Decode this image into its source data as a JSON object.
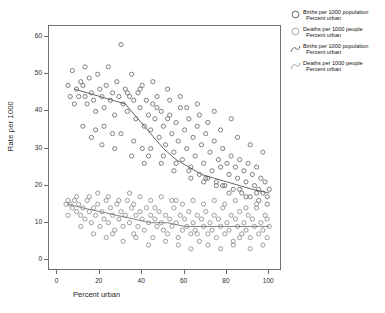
{
  "chart_data": {
    "type": "scatter",
    "title": "",
    "xlabel": "Percent urban",
    "ylabel": "Rate per 1000",
    "xlim": [
      -4,
      106
    ],
    "ylim": [
      -3,
      63
    ],
    "xticks": [
      0,
      20,
      40,
      60,
      80,
      100
    ],
    "yticks": [
      0,
      10,
      20,
      30,
      40,
      50,
      60
    ],
    "grid": false,
    "legend_position": "right",
    "marker": "open-circle",
    "series": [
      {
        "name": "Births per 1000 population",
        "sub": "Percent urban",
        "color": "#6a6a6a",
        "points": [
          [
            7,
            51
          ],
          [
            9,
            46
          ],
          [
            10,
            44
          ],
          [
            12,
            47
          ],
          [
            13,
            44
          ],
          [
            14,
            42
          ],
          [
            15,
            49
          ],
          [
            16,
            45
          ],
          [
            17,
            43
          ],
          [
            18,
            40
          ],
          [
            19,
            50
          ],
          [
            20,
            46
          ],
          [
            21,
            44
          ],
          [
            22,
            41
          ],
          [
            23,
            47
          ],
          [
            24,
            52
          ],
          [
            25,
            43
          ],
          [
            26,
            45
          ],
          [
            27,
            39
          ],
          [
            28,
            48
          ],
          [
            29,
            44
          ],
          [
            30,
            58
          ],
          [
            31,
            42
          ],
          [
            32,
            46
          ],
          [
            33,
            40
          ],
          [
            34,
            44
          ],
          [
            35,
            50
          ],
          [
            36,
            43
          ],
          [
            37,
            38
          ],
          [
            38,
            45
          ],
          [
            39,
            41
          ],
          [
            40,
            47
          ],
          [
            41,
            36
          ],
          [
            42,
            43
          ],
          [
            43,
            39
          ],
          [
            44,
            35
          ],
          [
            45,
            42
          ],
          [
            46,
            38
          ],
          [
            47,
            44
          ],
          [
            48,
            33
          ],
          [
            49,
            40
          ],
          [
            50,
            36
          ],
          [
            51,
            31
          ],
          [
            52,
            38
          ],
          [
            53,
            43
          ],
          [
            54,
            34
          ],
          [
            55,
            29
          ],
          [
            56,
            37
          ],
          [
            57,
            32
          ],
          [
            58,
            41
          ],
          [
            59,
            27
          ],
          [
            60,
            35
          ],
          [
            61,
            30
          ],
          [
            62,
            38
          ],
          [
            63,
            25
          ],
          [
            64,
            33
          ],
          [
            65,
            28
          ],
          [
            66,
            36
          ],
          [
            67,
            23
          ],
          [
            68,
            31
          ],
          [
            69,
            26
          ],
          [
            70,
            34
          ],
          [
            71,
            22
          ],
          [
            72,
            29
          ],
          [
            73,
            24
          ],
          [
            74,
            32
          ],
          [
            75,
            21
          ],
          [
            76,
            27
          ],
          [
            77,
            25
          ],
          [
            78,
            30
          ],
          [
            79,
            20
          ],
          [
            80,
            26
          ],
          [
            81,
            23
          ],
          [
            82,
            28
          ],
          [
            83,
            19
          ],
          [
            84,
            25
          ],
          [
            85,
            22
          ],
          [
            86,
            27
          ],
          [
            87,
            18
          ],
          [
            88,
            24
          ],
          [
            89,
            21
          ],
          [
            90,
            26
          ],
          [
            91,
            17
          ],
          [
            92,
            23
          ],
          [
            93,
            20
          ],
          [
            94,
            25
          ],
          [
            95,
            19
          ],
          [
            96,
            22
          ],
          [
            97,
            18
          ],
          [
            98,
            21
          ],
          [
            99,
            17
          ],
          [
            100,
            19
          ],
          [
            5,
            47
          ],
          [
            6,
            44
          ],
          [
            8,
            42
          ],
          [
            11,
            48
          ],
          [
            13,
            52
          ],
          [
            45,
            48
          ],
          [
            52,
            46
          ],
          [
            58,
            44
          ],
          [
            66,
            42
          ],
          [
            74,
            40
          ],
          [
            82,
            38
          ],
          [
            44,
            30
          ],
          [
            50,
            28
          ],
          [
            56,
            26
          ],
          [
            62,
            24
          ],
          [
            70,
            22
          ],
          [
            78,
            20
          ],
          [
            86,
            19
          ],
          [
            94,
            18
          ],
          [
            30,
            34
          ],
          [
            36,
            32
          ],
          [
            40,
            30
          ],
          [
            22,
            36
          ],
          [
            26,
            34
          ],
          [
            18,
            35
          ],
          [
            33,
            45
          ],
          [
            39,
            46
          ],
          [
            47,
            41
          ],
          [
            53,
            39
          ],
          [
            61,
            41
          ],
          [
            67,
            39
          ],
          [
            71,
            37
          ],
          [
            77,
            35
          ],
          [
            85,
            33
          ],
          [
            91,
            31
          ],
          [
            97,
            29
          ],
          [
            43,
            28
          ],
          [
            49,
            26
          ],
          [
            55,
            24
          ],
          [
            63,
            22
          ],
          [
            69,
            21
          ],
          [
            75,
            20
          ],
          [
            81,
            18
          ],
          [
            89,
            17
          ],
          [
            95,
            16
          ],
          [
            99,
            15
          ],
          [
            12,
            36
          ],
          [
            16,
            33
          ],
          [
            21,
            31
          ],
          [
            27,
            30
          ],
          [
            35,
            28
          ],
          [
            41,
            26
          ]
        ]
      },
      {
        "name": "Deaths per 1000 people",
        "sub": "Percent urban",
        "color": "#8c8c8c",
        "points": [
          [
            5,
            16
          ],
          [
            6,
            15
          ],
          [
            7,
            14
          ],
          [
            8,
            16
          ],
          [
            9,
            13
          ],
          [
            10,
            15
          ],
          [
            11,
            12
          ],
          [
            12,
            14
          ],
          [
            13,
            11
          ],
          [
            14,
            16
          ],
          [
            15,
            13
          ],
          [
            16,
            10
          ],
          [
            17,
            14
          ],
          [
            18,
            12
          ],
          [
            19,
            15
          ],
          [
            20,
            9
          ],
          [
            21,
            13
          ],
          [
            22,
            11
          ],
          [
            23,
            16
          ],
          [
            24,
            10
          ],
          [
            25,
            14
          ],
          [
            26,
            12
          ],
          [
            27,
            8
          ],
          [
            28,
            15
          ],
          [
            29,
            11
          ],
          [
            30,
            13
          ],
          [
            31,
            9
          ],
          [
            32,
            12
          ],
          [
            33,
            16
          ],
          [
            34,
            10
          ],
          [
            35,
            14
          ],
          [
            36,
            7
          ],
          [
            37,
            12
          ],
          [
            38,
            9
          ],
          [
            39,
            13
          ],
          [
            40,
            11
          ],
          [
            41,
            8
          ],
          [
            42,
            14
          ],
          [
            43,
            10
          ],
          [
            44,
            12
          ],
          [
            45,
            6
          ],
          [
            46,
            11
          ],
          [
            47,
            9
          ],
          [
            48,
            13
          ],
          [
            49,
            10
          ],
          [
            50,
            8
          ],
          [
            51,
            12
          ],
          [
            52,
            7
          ],
          [
            53,
            11
          ],
          [
            54,
            9
          ],
          [
            55,
            14
          ],
          [
            56,
            10
          ],
          [
            57,
            6
          ],
          [
            58,
            12
          ],
          [
            59,
            8
          ],
          [
            60,
            11
          ],
          [
            61,
            9
          ],
          [
            62,
            13
          ],
          [
            63,
            7
          ],
          [
            64,
            10
          ],
          [
            65,
            8
          ],
          [
            66,
            12
          ],
          [
            67,
            5
          ],
          [
            68,
            11
          ],
          [
            69,
            9
          ],
          [
            70,
            13
          ],
          [
            71,
            7
          ],
          [
            72,
            10
          ],
          [
            73,
            8
          ],
          [
            74,
            12
          ],
          [
            75,
            6
          ],
          [
            76,
            11
          ],
          [
            77,
            9
          ],
          [
            78,
            14
          ],
          [
            79,
            7
          ],
          [
            80,
            10
          ],
          [
            81,
            8
          ],
          [
            82,
            12
          ],
          [
            83,
            5
          ],
          [
            84,
            11
          ],
          [
            85,
            9
          ],
          [
            86,
            13
          ],
          [
            87,
            7
          ],
          [
            88,
            10
          ],
          [
            89,
            8
          ],
          [
            90,
            12
          ],
          [
            91,
            6
          ],
          [
            92,
            11
          ],
          [
            93,
            9
          ],
          [
            94,
            14
          ],
          [
            95,
            7
          ],
          [
            96,
            10
          ],
          [
            97,
            8
          ],
          [
            98,
            12
          ],
          [
            99,
            6
          ],
          [
            100,
            9
          ],
          [
            4,
            15
          ],
          [
            5,
            12
          ],
          [
            9,
            17
          ],
          [
            15,
            17
          ],
          [
            19,
            18
          ],
          [
            24,
            17
          ],
          [
            29,
            16
          ],
          [
            34,
            18
          ],
          [
            39,
            17
          ],
          [
            44,
            16
          ],
          [
            49,
            17
          ],
          [
            54,
            16
          ],
          [
            59,
            15
          ],
          [
            64,
            16
          ],
          [
            69,
            15
          ],
          [
            74,
            16
          ],
          [
            79,
            15
          ],
          [
            84,
            16
          ],
          [
            89,
            14
          ],
          [
            94,
            15
          ],
          [
            99,
            11
          ],
          [
            11,
            9
          ],
          [
            17,
            7
          ],
          [
            23,
            6
          ],
          [
            31,
            5
          ],
          [
            37,
            6
          ],
          [
            43,
            4
          ],
          [
            51,
            5
          ],
          [
            57,
            4
          ],
          [
            63,
            3
          ],
          [
            71,
            4
          ],
          [
            77,
            3
          ],
          [
            83,
            4
          ],
          [
            91,
            3
          ],
          [
            97,
            4
          ],
          [
            26,
            7
          ],
          [
            46,
            14
          ],
          [
            66,
            7
          ],
          [
            86,
            6
          ],
          [
            36,
            15
          ],
          [
            56,
            16
          ]
        ]
      }
    ],
    "fits": [
      {
        "name": "Births per 1000 population",
        "sub": "Percent urban",
        "color": "#555555",
        "points": [
          [
            8,
            46
          ],
          [
            14,
            45
          ],
          [
            20,
            44
          ],
          [
            26,
            43
          ],
          [
            32,
            42
          ],
          [
            38,
            38
          ],
          [
            44,
            34
          ],
          [
            50,
            30
          ],
          [
            56,
            27
          ],
          [
            62,
            25
          ],
          [
            68,
            23
          ],
          [
            74,
            22
          ],
          [
            80,
            21
          ],
          [
            86,
            20
          ],
          [
            92,
            19
          ],
          [
            100,
            18
          ]
        ]
      },
      {
        "name": "Deaths per 1000 people",
        "sub": "Percent urban",
        "color": "#777777",
        "points": [
          [
            5,
            15
          ],
          [
            12,
            14
          ],
          [
            20,
            13
          ],
          [
            28,
            12
          ],
          [
            36,
            11
          ],
          [
            44,
            10
          ],
          [
            52,
            10
          ],
          [
            60,
            9
          ],
          [
            68,
            9
          ],
          [
            76,
            9
          ],
          [
            84,
            9
          ],
          [
            92,
            9
          ],
          [
            100,
            9
          ]
        ]
      }
    ]
  },
  "legend": {
    "items": [
      {
        "key": "open-circle-dark",
        "line1": "Births per 1000 population",
        "line2": "Percent urban"
      },
      {
        "key": "open-circle-light",
        "line1": "Deaths per 1000 people",
        "line2": "Percent urban"
      },
      {
        "key": "curve-dark",
        "line1": "Births per 1000 population",
        "line2": "Percent urban"
      },
      {
        "key": "curve-light",
        "line1": "Deaths per 1000 people",
        "line2": "Percent urban"
      }
    ]
  },
  "colors": {
    "frame": "#6f6f6f",
    "marker_births": "#6a6a6a",
    "marker_deaths": "#8c8c8c",
    "background": "#ffffff"
  }
}
